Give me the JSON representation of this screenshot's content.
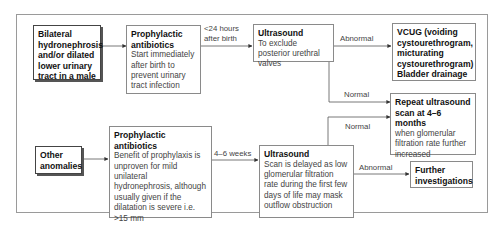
{
  "diagram": {
    "nodes": {
      "bilateral": {
        "title": "Bilateral hydronephrosis and/or dilated lower urinary tract in a male"
      },
      "prophylactic_top": {
        "title": "Prophylactic antibiotics",
        "desc": "Start immediately after birth to prevent urinary tract infection"
      },
      "ultrasound_top": {
        "title": "Ultrasound",
        "desc": "To exclude posterior urethral valves"
      },
      "vcug": {
        "title": "VCUG (voiding cystourethrogram, micturating cystourethrogram) Bladder drainage"
      },
      "repeat_ultrasound": {
        "title": "Repeat ultrasound scan at 4–6 months",
        "desc": "when glomerular filtration rate further increased"
      },
      "other_anomalies": {
        "title": "Other anomalies"
      },
      "prophylactic_bottom": {
        "title": "Prophylactic antibiotics",
        "desc": "Benefit of prophylaxis is unproven for mild unilateral hydronephrosis, although usually given if the dilatation is severe i.e. >15 mm"
      },
      "ultrasound_bottom": {
        "title": "Ultrasound",
        "desc": "Scan is delayed as low glomerular filtration rate during the first few days of life may mask outflow obstruction"
      },
      "further": {
        "title": "Further investigations"
      }
    },
    "edge_labels": {
      "within_24h": "<24 hours after birth",
      "abnormal_top": "Abnormal",
      "normal_top": "Normal",
      "weeks_4_6": "4–6 weeks",
      "normal_bottom": "Normal",
      "abnormal_bottom": "Abnormal"
    },
    "colors": {
      "border": "#8a8a8a",
      "frame": "#9a9a9a",
      "line": "#555555",
      "title_text": "#111111",
      "desc_text": "#444444"
    }
  }
}
